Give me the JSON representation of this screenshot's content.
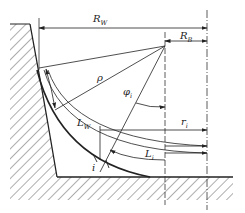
{
  "diagram": {
    "type": "engineering-cross-section",
    "labels": {
      "R_W": {
        "main": "R",
        "sub": "W"
      },
      "R_B": {
        "main": "R",
        "sub": "B"
      },
      "rho": {
        "main": "ρ",
        "sub": ""
      },
      "phi_i": {
        "main": "φ",
        "sub": "i"
      },
      "L_W": {
        "main": "L",
        "sub": "W"
      },
      "r_i": {
        "main": "r",
        "sub": "i"
      },
      "L_i": {
        "main": "L",
        "sub": "i"
      },
      "i": {
        "main": "i",
        "sub": ""
      }
    },
    "colors": {
      "line": "#222222",
      "background": "#ffffff"
    }
  }
}
